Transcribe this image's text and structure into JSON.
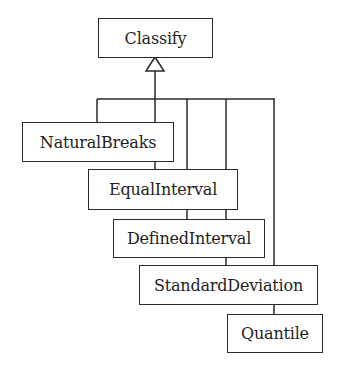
{
  "diagram": {
    "type": "uml-class-inheritance",
    "colors": {
      "line": "#2a2a2a",
      "text": "#1e1e1e",
      "background": "#ffffff"
    },
    "parent": {
      "id": "classify",
      "label": "Classify"
    },
    "classes": [
      {
        "id": "natural-breaks",
        "label": "NaturalBreaks"
      },
      {
        "id": "equal-interval",
        "label": "EqualInterval"
      },
      {
        "id": "defined-interval",
        "label": "DefinedInterval"
      },
      {
        "id": "standard-deviation",
        "label": "StandardDeviation"
      },
      {
        "id": "quantile",
        "label": "Quantile"
      }
    ],
    "relationships": [
      {
        "from": "NaturalBreaks",
        "to": "Classify",
        "kind": "generalization"
      },
      {
        "from": "EqualInterval",
        "to": "Classify",
        "kind": "generalization"
      },
      {
        "from": "DefinedInterval",
        "to": "Classify",
        "kind": "generalization"
      },
      {
        "from": "StandardDeviation",
        "to": "Classify",
        "kind": "generalization"
      },
      {
        "from": "Quantile",
        "to": "Classify",
        "kind": "generalization"
      }
    ],
    "arrowhead": "hollow-triangle-icon"
  }
}
